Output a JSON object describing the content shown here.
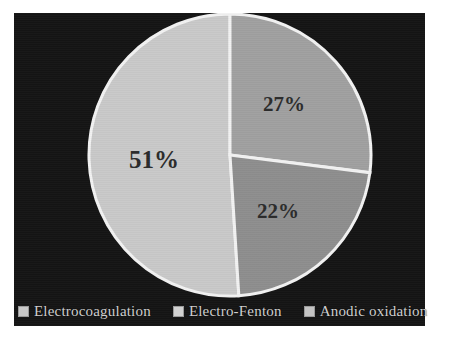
{
  "chart_data": {
    "type": "pie",
    "title": "",
    "categories": [
      "Electrocoagulation",
      "Electro-Fenton",
      "Anodic oxidation"
    ],
    "values": [
      51,
      27,
      22
    ],
    "value_labels": [
      "51%",
      "27%",
      "22%"
    ],
    "unit": "%",
    "legend_position": "bottom",
    "grid": false,
    "start_angle_deg": 0,
    "direction": "counterclockwise",
    "colors": [
      "#c9c9c9",
      "#a0a0a0",
      "#8e8e8e"
    ],
    "slice_border_color": "#f2f2f2",
    "background_color": "#141414",
    "label_color": "#2b2b2b",
    "legend_text_color": "#cfcfcf",
    "slices": [
      {
        "label": "Electrocoagulation",
        "value": 51,
        "display": "51%",
        "color": "#c9c9c9"
      },
      {
        "label": "Electro-Fenton",
        "value": 27,
        "display": "27%",
        "color": "#a0a0a0"
      },
      {
        "label": "Anodic oxidation",
        "value": 22,
        "display": "22%",
        "color": "#8e8e8e"
      }
    ]
  },
  "legend": {
    "items": [
      {
        "label": "Electrocoagulation",
        "color": "#c9c9c9"
      },
      {
        "label": "Electro-Fenton",
        "color": "#d2d2d2"
      },
      {
        "label": "Anodic oxidation",
        "color": "#c4c4c4"
      }
    ]
  }
}
